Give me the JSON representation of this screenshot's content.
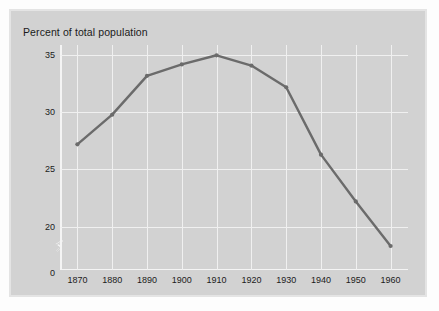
{
  "figure": {
    "background_color": "#fdfdfd",
    "panel_color": "#d2d2d2",
    "border_color": "#e4e4e4"
  },
  "chart_data": {
    "type": "line",
    "title": "Percent of total population",
    "subtitle": "",
    "xlabel": "",
    "ylabel": "",
    "x": [
      1870,
      1880,
      1890,
      1900,
      1910,
      1920,
      1930,
      1940,
      1950,
      1960
    ],
    "categories": [
      "1870",
      "1880",
      "1890",
      "1900",
      "1910",
      "1920",
      "1930",
      "1940",
      "1950",
      "1960"
    ],
    "values": [
      27.2,
      29.8,
      33.2,
      34.2,
      35.0,
      34.1,
      32.2,
      26.3,
      22.2,
      18.3
    ],
    "series": [
      {
        "name": "Percent of total population",
        "values": [
          27.2,
          29.8,
          33.2,
          34.2,
          35.0,
          34.1,
          32.2,
          26.3,
          22.2,
          18.3
        ],
        "color": "#6b6b6b",
        "marker": "circle",
        "line_width": 2.4
      }
    ],
    "xlim": [
      1865,
      1965
    ],
    "ylim": [
      16.2,
      35.9
    ],
    "yticks": [
      20,
      25,
      30,
      35
    ],
    "ytick_labels": [
      "20",
      "25",
      "30",
      "35"
    ],
    "y_zero_label": "0",
    "xticks": [
      1870,
      1880,
      1890,
      1900,
      1910,
      1920,
      1930,
      1940,
      1950,
      1960
    ],
    "xtick_labels": [
      "1870",
      "1880",
      "1890",
      "1900",
      "1910",
      "1920",
      "1930",
      "1940",
      "1950",
      "1960"
    ],
    "grid": true,
    "grid_color": "#f0f0f0",
    "axis_break": true,
    "axis_break_position": "y-axis-lower",
    "legend": false,
    "legend_position": "none"
  }
}
